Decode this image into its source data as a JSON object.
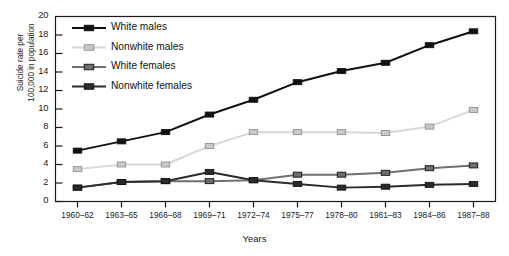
{
  "chart_data": {
    "type": "line",
    "title": "",
    "xlabel": "Years",
    "ylabel": "Suicide rate per 100,000 in population",
    "ylabel_line1": "Suicide rate per",
    "ylabel_line2": "100,000 in population",
    "categories": [
      "1960–62",
      "1963–65",
      "1966–68",
      "1969–71",
      "1972–74",
      "1975–77",
      "1978–80",
      "1981–83",
      "1984–86",
      "1987–88"
    ],
    "ylim": [
      0,
      20
    ],
    "yticks": [
      0,
      2,
      4,
      6,
      8,
      10,
      12,
      14,
      16,
      18,
      20
    ],
    "ytick_labels": [
      "0",
      "2",
      "4",
      "6",
      "8",
      "10",
      "12",
      "14",
      "16",
      "18",
      "20"
    ],
    "grid": false,
    "legend_position": "upper-left-inside",
    "series": [
      {
        "name": "White males",
        "color": "#111111",
        "marker_fill": "#111111",
        "values": [
          5.5,
          6.5,
          7.5,
          9.4,
          11.0,
          12.9,
          14.1,
          15.0,
          16.9,
          18.4
        ]
      },
      {
        "name": "Nonwhite males",
        "color": "#d8d8d8",
        "marker_fill": "#c9c9c9",
        "values": [
          3.5,
          4.0,
          4.0,
          6.0,
          7.5,
          7.5,
          7.5,
          7.4,
          8.1,
          9.9
        ]
      },
      {
        "name": "White females",
        "color": "#707070",
        "marker_fill": "#6e6e6e",
        "values": [
          1.5,
          2.1,
          2.2,
          2.2,
          2.3,
          2.9,
          2.9,
          3.1,
          3.6,
          3.9
        ]
      },
      {
        "name": "Nonwhite females",
        "color": "#2b2b2b",
        "marker_fill": "#2b2b2b",
        "values": [
          1.5,
          2.1,
          2.2,
          3.2,
          2.3,
          1.9,
          1.5,
          1.6,
          1.8,
          1.9
        ]
      }
    ]
  }
}
